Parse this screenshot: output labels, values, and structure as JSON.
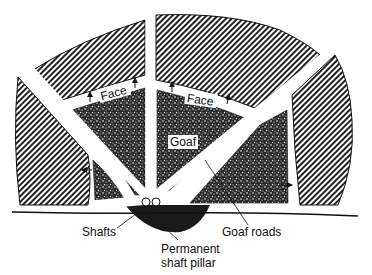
{
  "diagram": {
    "title": "",
    "labels": {
      "face_left": "Face",
      "face_right": "Face",
      "goaf": "Goaf",
      "shafts": "Shafts",
      "pillar_line1": "Permanent",
      "pillar_line2": "shaft pillar",
      "goaf_roads": "Goaf roads"
    },
    "regions": [
      {
        "name": "unworked-coal",
        "pattern": "diagonal-hatch"
      },
      {
        "name": "goaf",
        "pattern": "stipple"
      },
      {
        "name": "shaft-pillar",
        "pattern": "solid-dark"
      },
      {
        "name": "roadways",
        "pattern": "white"
      }
    ],
    "colors": {
      "ink": "#111111",
      "background": "#ffffff"
    }
  }
}
